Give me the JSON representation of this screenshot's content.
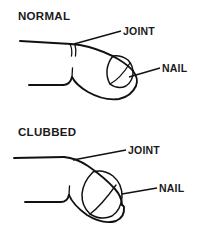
{
  "figure": {
    "background_color": "#ffffff",
    "ink_color": "#111111",
    "style": "line-art medical illustration"
  },
  "panels": [
    {
      "id": "normal",
      "title": "NORMAL",
      "callouts": [
        {
          "id": "joint",
          "label": "JOINT"
        },
        {
          "id": "nail",
          "label": "NAIL"
        }
      ]
    },
    {
      "id": "clubbed",
      "title": "CLUBBED",
      "callouts": [
        {
          "id": "joint",
          "label": "JOINT"
        },
        {
          "id": "nail",
          "label": "NAIL"
        }
      ]
    }
  ]
}
